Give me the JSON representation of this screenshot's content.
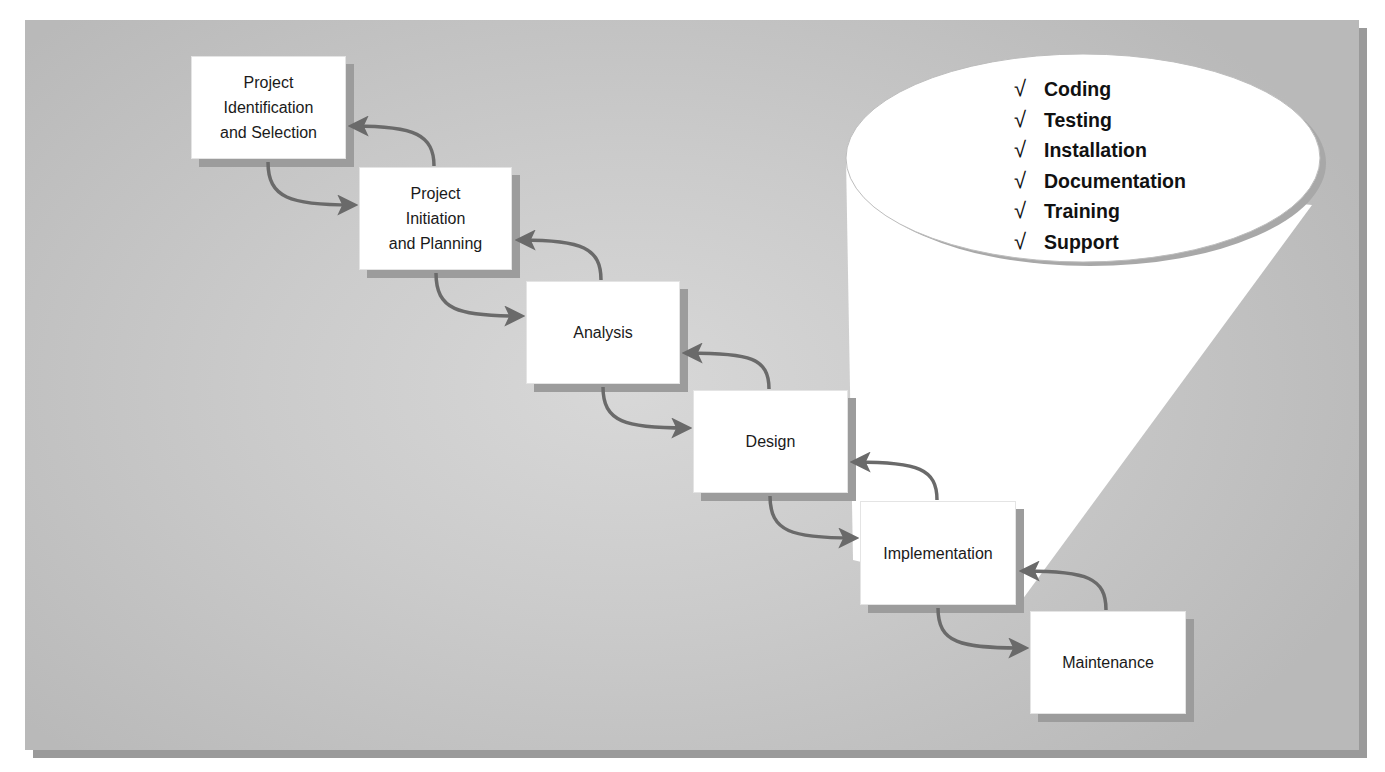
{
  "diagram": {
    "colors": {
      "panel_background": "#c9c9c9",
      "box_fill": "#ffffff",
      "box_shadow": "#9c9c9c",
      "arrow": "#6a6a6a",
      "callout_fill": "#ffffff"
    },
    "phases": [
      {
        "id": "phase-1",
        "lines": [
          "Project",
          "Identification",
          "and Selection"
        ]
      },
      {
        "id": "phase-2",
        "lines": [
          "Project",
          "Initiation",
          "and Planning"
        ]
      },
      {
        "id": "phase-3",
        "lines": [
          "Analysis"
        ]
      },
      {
        "id": "phase-4",
        "lines": [
          "Design"
        ]
      },
      {
        "id": "phase-5",
        "lines": [
          "Implementation"
        ]
      },
      {
        "id": "phase-6",
        "lines": [
          "Maintenance"
        ]
      }
    ],
    "callout": {
      "attached_to": "Implementation",
      "check_glyph": "√",
      "items": [
        "Coding",
        "Testing",
        "Installation",
        "Documentation",
        "Training",
        "Support"
      ]
    }
  }
}
